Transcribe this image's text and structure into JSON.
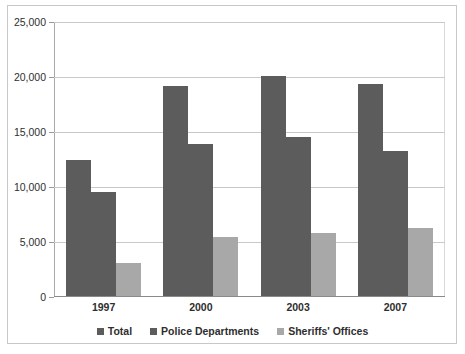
{
  "chart_data": {
    "type": "bar",
    "title": "",
    "subtitle": "",
    "xlabel": "",
    "ylabel": "",
    "categories": [
      "1997",
      "2000",
      "2003",
      "2007"
    ],
    "series": [
      {
        "name": "Total",
        "color": "#5c5c5c",
        "values": [
          12400,
          19100,
          20000,
          19300
        ]
      },
      {
        "name": "Police Departments",
        "color": "#5c5c5c",
        "values": [
          9500,
          13800,
          14500,
          13200
        ]
      },
      {
        "name": "Sheriffs' Offices",
        "color": "#a8a8a8",
        "values": [
          3000,
          5400,
          5700,
          6200
        ]
      }
    ],
    "ylim": [
      0,
      25000
    ],
    "ytick_values": [
      0,
      5000,
      10000,
      15000,
      20000,
      25000
    ],
    "ytick_labels": [
      "0",
      "5,000",
      "10,000",
      "15,000",
      "20,000",
      "25,000"
    ],
    "grid": true,
    "legend_position": "bottom"
  },
  "legend": {
    "items": [
      {
        "label": "Total",
        "color": "#5c5c5c"
      },
      {
        "label": "Police Departments",
        "color": "#5c5c5c"
      },
      {
        "label": "Sheriffs' Offices",
        "color": "#a8a8a8"
      }
    ]
  },
  "colors": {
    "dark_bar": "#5c5c5c",
    "light_bar": "#a8a8a8",
    "gridline": "#c9c9c9",
    "border": "#c8c8c8",
    "text": "#2e2e2e",
    "background": "#ffffff"
  }
}
